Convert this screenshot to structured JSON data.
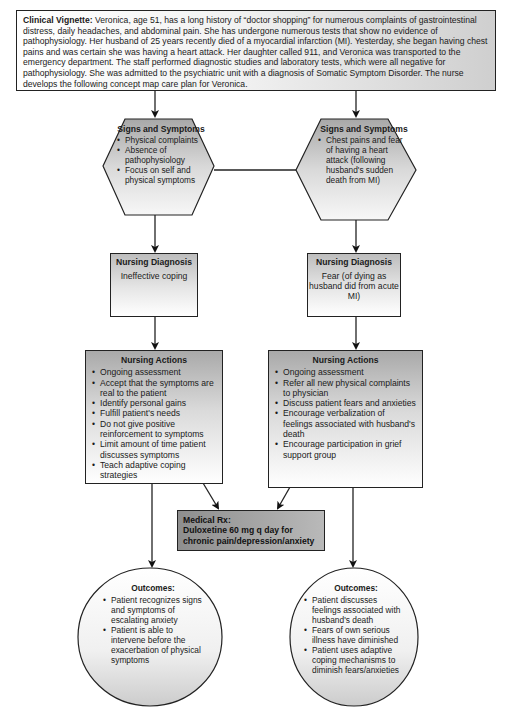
{
  "vignette": {
    "label": "Clinical Vignette:",
    "text": " Veronica, age 51, has a long history of “doctor shopping” for numerous complaints of gastrointestinal distress, daily headaches, and abdominal pain. She has undergone numerous tests that show no evidence of pathophysiology. Her husband of 25 years recently died of a myocardial infarction (MI). Yesterday, she began having chest pains and was certain she was having a heart attack. Her daughter called 911, and Veronica was transported to the emergency department. The staff performed diagnostic studies and laboratory tests, which were all negative for pathophysiology. She was admitted to the psychiatric unit with a diagnosis of Somatic Symptom Disorder. The nurse develops the following concept map care plan for Veronica."
  },
  "left": {
    "signs": {
      "title": "Signs and Symptoms",
      "items": [
        "Physical complaints",
        "Absence of pathophysiology",
        "Focus on self and physical symptoms"
      ]
    },
    "diagnosis": {
      "title": "Nursing Diagnosis",
      "value": "Ineffective coping"
    },
    "actions": {
      "title": "Nursing Actions",
      "items": [
        "Ongoing assessment",
        "Accept that the symptoms are real to the patient",
        "Identify personal gains",
        "Fulfill patient's needs",
        "Do not give positive reinforcement to symptoms",
        "Limit amount of time patient discusses symptoms",
        "Teach adaptive coping strategies"
      ]
    },
    "outcomes": {
      "title": "Outcomes:",
      "items": [
        "Patient recognizes signs and symptoms of escalating anxiety",
        "Patient is able to intervene before the exacerbation of physical symptoms"
      ]
    }
  },
  "right": {
    "signs": {
      "title": "Signs and Symptoms",
      "items": [
        "Chest pains and fear of having a heart attack (following husband's sudden death from MI)"
      ]
    },
    "diagnosis": {
      "title": "Nursing Diagnosis",
      "value": "Fear (of dying as husband did from acute MI)"
    },
    "actions": {
      "title": "Nursing Actions",
      "items": [
        "Ongoing assessment",
        "Refer all new physical complaints to physician",
        "Discuss patient fears and anxieties",
        "Encourage verbalization of feelings associated with husband's death",
        "Encourage participation in grief support group"
      ]
    },
    "outcomes": {
      "title": "Outcomes:",
      "items": [
        "Patient discusses feelings associated with husband's death",
        "Fears of own serious illness have diminished",
        "Patient uses adaptive coping mechanisms to diminish fears/anxieties"
      ]
    }
  },
  "medical_rx": {
    "title": "Medical Rx:",
    "text": "Duloxetine 60 mg q day for chronic pain/depression/anxiety"
  }
}
